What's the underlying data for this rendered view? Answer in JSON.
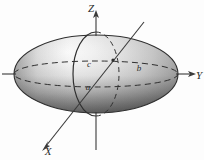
{
  "figure": {
    "background_color": "#fdfdfd",
    "stroke_color": "#2b2b2b",
    "surface_light": "#f2f2f2",
    "surface_mid": "#b9b9b9",
    "surface_dark": "#5a5a5a",
    "axes": [
      {
        "name": "z-axis",
        "label": "Z",
        "direction": "up"
      },
      {
        "name": "y-axis",
        "label": "Y",
        "direction": "right"
      },
      {
        "name": "x-axis",
        "label": "X",
        "direction": "down-left"
      }
    ],
    "semi_axes": [
      {
        "name": "semi-axis-c",
        "label": "c",
        "axis": "z"
      },
      {
        "name": "semi-axis-b",
        "label": "b",
        "axis": "y"
      },
      {
        "name": "semi-axis-a",
        "label": "a",
        "axis": "x"
      }
    ],
    "origin_label": "",
    "cross_sections": [
      {
        "name": "equatorial-ellipse",
        "plane": "xy",
        "style": "dashed"
      },
      {
        "name": "meridian-ellipse",
        "plane": "xz",
        "style": "solid-front-dashed-back"
      }
    ]
  }
}
